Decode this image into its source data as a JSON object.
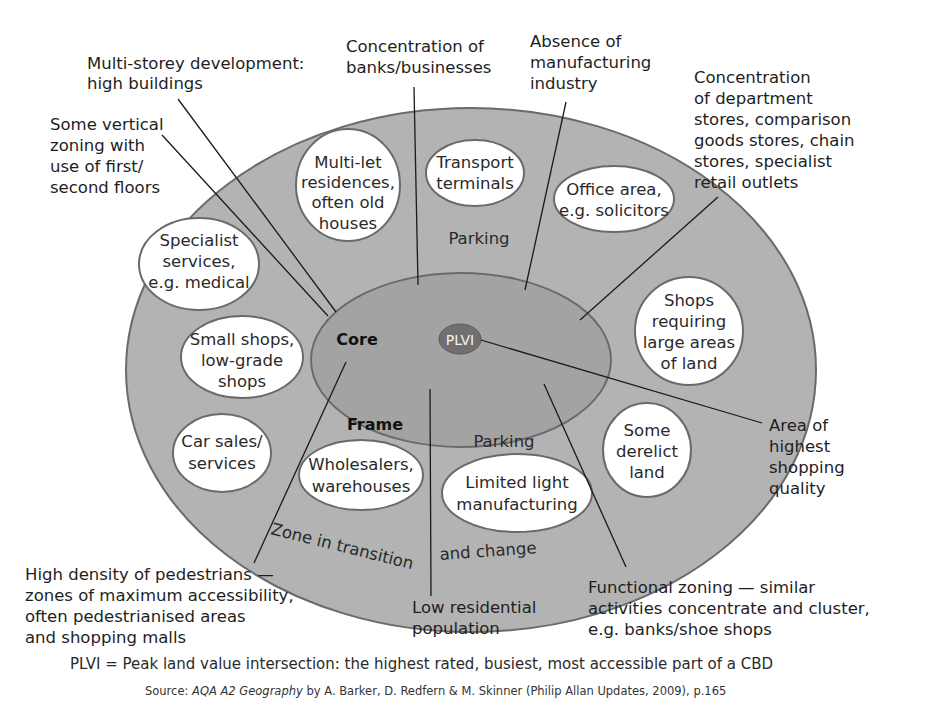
{
  "diagram": {
    "zones": {
      "outer": {
        "label": "Zone in transition and change",
        "color": "#b3b3b3"
      },
      "frame": {
        "label": "Frame"
      },
      "core": {
        "label": "Core",
        "color": "#a2a2a2"
      },
      "plvi": {
        "label": "PLVI",
        "color": "#6f6f6f"
      }
    },
    "bubbles": [
      {
        "id": "multi-let",
        "lines": [
          "Multi-let",
          "residences,",
          "often old",
          "houses"
        ]
      },
      {
        "id": "transport",
        "lines": [
          "Transport",
          "terminals"
        ]
      },
      {
        "id": "office",
        "lines": [
          "Office area,",
          "e.g. solicitors"
        ]
      },
      {
        "id": "specialist",
        "lines": [
          "Specialist",
          "services,",
          "e.g. medical"
        ]
      },
      {
        "id": "small-shops",
        "lines": [
          "Small shops,",
          "low-grade",
          "shops"
        ]
      },
      {
        "id": "shops-large",
        "lines": [
          "Shops",
          "requiring",
          "large areas",
          "of land"
        ]
      },
      {
        "id": "car-sales",
        "lines": [
          "Car sales/",
          "services"
        ]
      },
      {
        "id": "wholesalers",
        "lines": [
          "Wholesalers,",
          "warehouses"
        ]
      },
      {
        "id": "light-manufacturing",
        "lines": [
          "Limited light",
          "manufacturing"
        ]
      },
      {
        "id": "derelict",
        "lines": [
          "Some",
          "derelict",
          "land"
        ]
      }
    ],
    "parking_labels": [
      "Parking",
      "Parking"
    ],
    "annotations": {
      "multi_storey": [
        "Multi-storey development:",
        "high buildings"
      ],
      "vertical_zoning": [
        "Some vertical",
        "zoning with",
        "use of first/",
        "second floors"
      ],
      "banks": [
        "Concentration of",
        "banks/businesses"
      ],
      "manufacturing": [
        "Absence of",
        "manufacturing",
        "industry"
      ],
      "department_stores": [
        "Concentration",
        "of department",
        "stores, comparison",
        "goods stores, chain",
        "stores, specialist",
        "retail outlets"
      ],
      "shopping_quality": [
        "Area of",
        "highest",
        "shopping",
        "quality"
      ],
      "pedestrians": [
        "High density of pedestrians —",
        "zones of maximum accessibility,",
        "often pedestrianised areas",
        "and shopping malls"
      ],
      "residential": [
        "Low residential",
        "population"
      ],
      "functional_zoning": [
        "Functional zoning — similar",
        "activities concentrate and cluster,",
        "e.g. banks/shoe shops"
      ]
    },
    "footnote": "PLVI = Peak land value intersection: the highest rated, busiest, most accessible part of a CBD",
    "source": {
      "prefix": "Source: ",
      "title": "AQA A2 Geography",
      "rest": " by A. Barker, D. Redfern & M. Skinner (Philip Allan Updates, 2009), p.165"
    }
  }
}
